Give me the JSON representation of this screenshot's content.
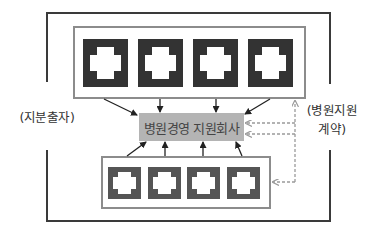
{
  "diagram": {
    "center_label": "병원경영 지원회사",
    "left_label": "(지분출자)",
    "right_label_line1": "(병원지원",
    "right_label_line2": "계약)",
    "colors": {
      "frame": "#3a3a3a",
      "box_border": "#8c8c8c",
      "icon_top": "#333333",
      "icon_bottom": "#555555",
      "label_bg": "#b4b4b4",
      "dashed": "#9a9a9a",
      "arrow": "#222222"
    },
    "top_group": {
      "name": "upper hospitals",
      "icons": [
        "hospital-cross",
        "hospital-cross",
        "hospital-cross",
        "hospital-cross"
      ]
    },
    "bottom_group": {
      "name": "lower hospitals",
      "icons": [
        "hospital-cross",
        "hospital-cross",
        "hospital-cross",
        "hospital-cross"
      ]
    }
  }
}
